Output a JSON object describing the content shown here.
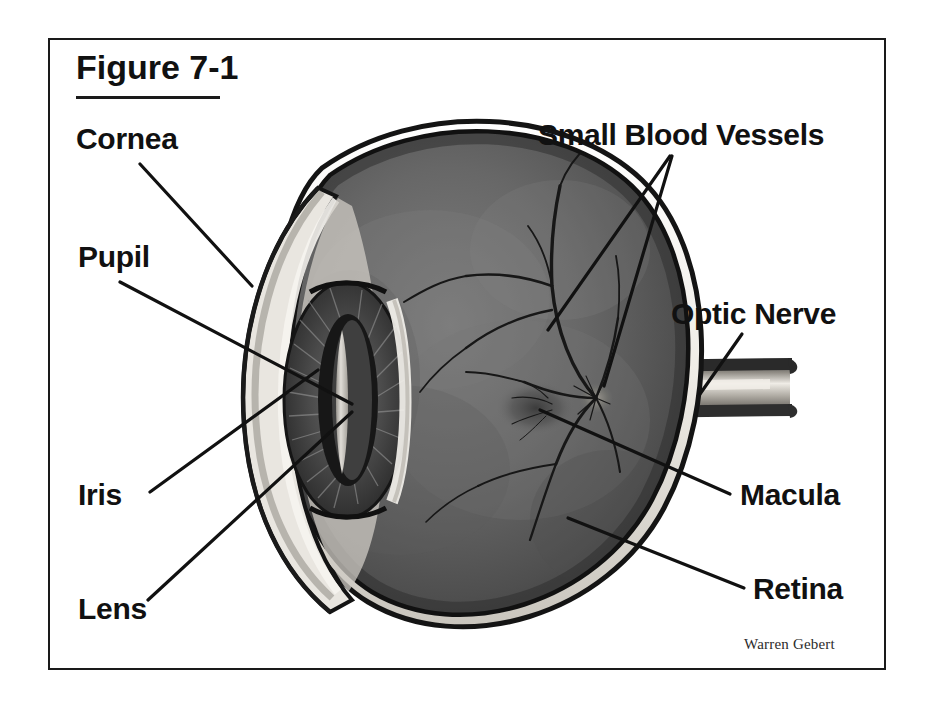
{
  "figure": {
    "title": "Figure 7-1",
    "artist_credit": "Warren Gebert",
    "frame_color": "#1a1a1a",
    "background_color": "#ffffff"
  },
  "labels": {
    "cornea": "Cornea",
    "pupil": "Pupil",
    "iris": "Iris",
    "lens": "Lens",
    "small_blood_vessels": "Small Blood Vessels",
    "optic_nerve": "Optic Nerve",
    "macula": "Macula",
    "retina": "Retina"
  },
  "palette": {
    "ink": "#111111",
    "sclera_white": "#f4f2ee",
    "sclera_shadow": "#b9b5ae",
    "vitreous_dark": "#4a4a4a",
    "retina_mid": "#6e6e6e",
    "retina_light": "#8d8d8d",
    "iris_dark": "#3a3a3a",
    "pupil_black": "#1c1c1c",
    "nerve_core": "#d8d5cf",
    "nerve_sheath": "#2a2a2a"
  }
}
